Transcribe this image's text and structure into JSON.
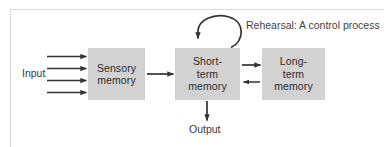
{
  "figure": {
    "border_color": "#d9d9d9",
    "background": "#ffffff"
  },
  "diagram": {
    "type": "flow-diagram",
    "box_fill": "#d2d2d2",
    "arrow_color": "#333333",
    "text_color": "#2b2b2b",
    "boxes": [
      {
        "id": "sensory-memory",
        "label": "Sensory\nmemory",
        "x": 88,
        "y": 48,
        "width": 57,
        "height": 52
      },
      {
        "id": "short-term-memory",
        "label": "Short-\nterm\nmemory",
        "x": 175,
        "y": 48,
        "width": 65,
        "height": 52
      },
      {
        "id": "long-term-memory",
        "label": "Long-\nterm\nmemory",
        "x": 262,
        "y": 48,
        "width": 63,
        "height": 52
      }
    ],
    "labels": [
      {
        "id": "input",
        "text": "Input",
        "x": 22,
        "y": 67
      },
      {
        "id": "output",
        "text": "Output",
        "x": 189,
        "y": 126
      },
      {
        "id": "rehearsal",
        "text": "Rehearsal: A control process",
        "x": 246,
        "y": 21
      }
    ],
    "connections": [
      {
        "id": "input-arrow-1",
        "from": "input",
        "to": "sensory-memory",
        "direction": "right"
      },
      {
        "id": "input-arrow-2",
        "from": "input",
        "to": "sensory-memory",
        "direction": "right"
      },
      {
        "id": "input-arrow-3",
        "from": "input",
        "to": "sensory-memory",
        "direction": "right"
      },
      {
        "id": "input-arrow-4",
        "from": "input",
        "to": "sensory-memory",
        "direction": "right"
      },
      {
        "id": "sensory-to-stm",
        "from": "sensory-memory",
        "to": "short-term-memory",
        "direction": "right"
      },
      {
        "id": "stm-to-ltm",
        "from": "short-term-memory",
        "to": "long-term-memory",
        "direction": "right"
      },
      {
        "id": "ltm-to-stm",
        "from": "long-term-memory",
        "to": "short-term-memory",
        "direction": "left"
      },
      {
        "id": "stm-to-output",
        "from": "short-term-memory",
        "to": "output",
        "direction": "down"
      },
      {
        "id": "rehearsal-loop",
        "from": "short-term-memory",
        "to": "short-term-memory",
        "direction": "loop"
      }
    ]
  }
}
